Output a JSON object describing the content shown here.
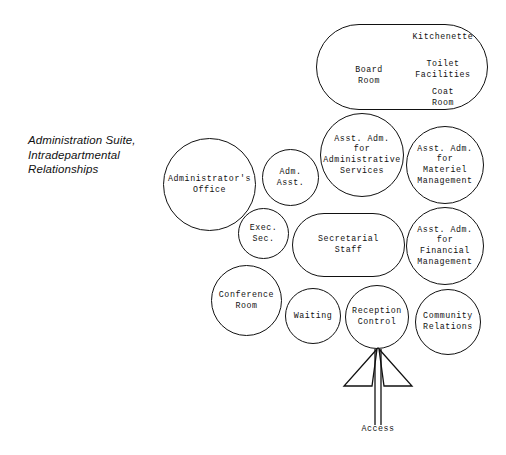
{
  "title": "Administration Suite,\nIntradepartmental\nRelationships",
  "diagram": {
    "type": "bubble-adjacency-diagram",
    "nodes": [
      {
        "id": "board-room",
        "label": "Board\nRoom",
        "shape": "stadium"
      },
      {
        "id": "kitchenette",
        "label": "Kitchenette",
        "shape": "label-in-stadium"
      },
      {
        "id": "toilet-facilities",
        "label": "Toilet\nFacilities",
        "shape": "label-in-stadium"
      },
      {
        "id": "coat-room",
        "label": "Coat\nRoom",
        "shape": "label-in-stadium"
      },
      {
        "id": "administrators-office",
        "label": "Administrator's\nOffice",
        "shape": "circle"
      },
      {
        "id": "adm-asst",
        "label": "Adm.\nAsst.",
        "shape": "circle"
      },
      {
        "id": "asst-adm-administrative-services",
        "label": "Asst. Adm.\nfor\nAdministrative\nServices",
        "shape": "circle"
      },
      {
        "id": "asst-adm-materiel-management",
        "label": "Asst. Adm.\nfor\nMateriel\nManagement",
        "shape": "circle"
      },
      {
        "id": "asst-adm-financial-management",
        "label": "Asst. Adm.\nfor\nFinancial\nManagement",
        "shape": "circle"
      },
      {
        "id": "exec-sec",
        "label": "Exec.\nSec.",
        "shape": "circle"
      },
      {
        "id": "secretarial-staff",
        "label": "Secretarial\nStaff",
        "shape": "stadium"
      },
      {
        "id": "conference-room",
        "label": "Conference\nRoom",
        "shape": "circle"
      },
      {
        "id": "waiting",
        "label": "Waiting",
        "shape": "circle"
      },
      {
        "id": "reception-control",
        "label": "Reception\nControl",
        "shape": "circle"
      },
      {
        "id": "community-relations",
        "label": "Community\nRelations",
        "shape": "circle"
      }
    ],
    "arrow": {
      "id": "access-arrow",
      "label": "Access",
      "points_to": "reception-control",
      "direction": "up"
    }
  },
  "colors": {
    "stroke": "#111111",
    "text": "#111111",
    "background": "#ffffff"
  }
}
